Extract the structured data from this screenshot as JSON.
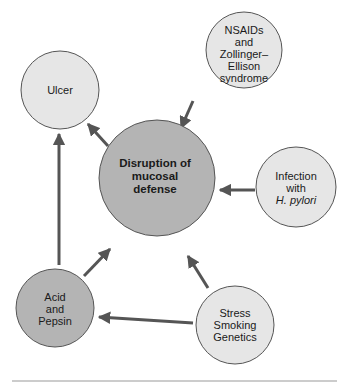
{
  "diagram": {
    "colors": {
      "light_node": "#e6e6e6",
      "dark_node": "#b4b4b4",
      "stroke": "#555555",
      "arrow": "#555555",
      "divider": "#999999"
    },
    "nodes": {
      "ulcer": {
        "lines": [
          "Ulcer"
        ]
      },
      "nsaids": {
        "lines": [
          "NSAIDs",
          "and",
          "Zollinger–",
          "Ellison",
          "syndrome"
        ]
      },
      "center": {
        "lines": [
          "Disruption of",
          "mucosal",
          "defense"
        ]
      },
      "infection": {
        "lines": [
          "Infection",
          "with",
          "H. pylori"
        ]
      },
      "acid": {
        "lines": [
          "Acid",
          "and",
          "Pepsin"
        ]
      },
      "stress": {
        "lines": [
          "Stress",
          "Smoking",
          "Genetics"
        ]
      }
    },
    "edges": [
      {
        "from": "center",
        "to": "ulcer"
      },
      {
        "from": "acid",
        "to": "ulcer"
      },
      {
        "from": "nsaids",
        "to": "center"
      },
      {
        "from": "infection",
        "to": "center"
      },
      {
        "from": "acid",
        "to": "center"
      },
      {
        "from": "stress",
        "to": "center"
      },
      {
        "from": "stress",
        "to": "acid"
      }
    ]
  }
}
